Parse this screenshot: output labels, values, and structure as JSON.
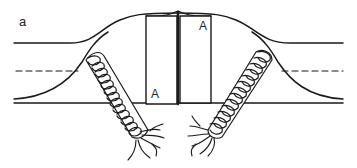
{
  "figure": {
    "panel_label": "a",
    "labels": {
      "left_block": "A",
      "right_block": "A"
    },
    "colors": {
      "line": "#1a1a1a",
      "background": "#ffffff"
    },
    "elements": [
      "upper-boundary-line",
      "dashed-midline",
      "lower-boundary-line",
      "central-bulge-curve",
      "left-block-A",
      "right-block-A",
      "left-coiled-tube",
      "right-coiled-tube",
      "left-frayed-ends",
      "right-frayed-ends"
    ]
  }
}
